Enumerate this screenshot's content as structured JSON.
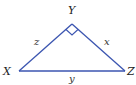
{
  "diagram": {
    "type": "right-triangle",
    "vertices": {
      "X": {
        "label": "X",
        "x": 19,
        "y": 71
      },
      "Y": {
        "label": "Y",
        "x": 72,
        "y": 24
      },
      "Z": {
        "label": "Z",
        "x": 125,
        "y": 71
      }
    },
    "sides": {
      "z": {
        "label": "z",
        "between": [
          "X",
          "Y"
        ]
      },
      "x": {
        "label": "x",
        "between": [
          "Y",
          "Z"
        ]
      },
      "y": {
        "label": "y",
        "between": [
          "X",
          "Z"
        ]
      }
    },
    "right_angle_at": "Y",
    "colors": {
      "line": "#3b55b0",
      "text": "#222222"
    }
  }
}
